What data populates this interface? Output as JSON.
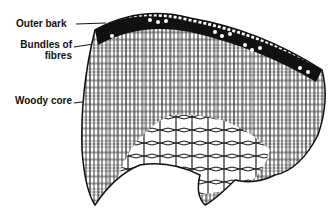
{
  "diagram": {
    "labels": [
      {
        "id": "outer-bark",
        "text": "Outer bark"
      },
      {
        "id": "bundles-line1",
        "text": "Bundles of"
      },
      {
        "id": "bundles-line2",
        "text": "fibres"
      },
      {
        "id": "woody-core",
        "text": "Woody core"
      }
    ],
    "colors": {
      "ink": "#111111",
      "background": "#ffffff"
    }
  }
}
